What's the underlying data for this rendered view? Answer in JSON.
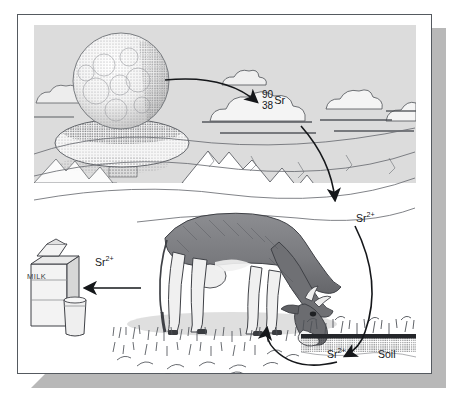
{
  "figure": {
    "type": "scientific-illustration"
  },
  "frame": {
    "border_color": "#555a60",
    "shadow_color": "#b8b8b8",
    "page_background": "#ffffff"
  },
  "sky": {
    "background_color": "#dcdcdc"
  },
  "labels": {
    "isotope": {
      "mass_number": "90",
      "atomic_number": "38",
      "symbol": "Sr"
    },
    "strontium_ion_air": {
      "symbol": "Sr",
      "charge": "2+"
    },
    "strontium_ion_milk": {
      "symbol": "Sr",
      "charge": "2+"
    },
    "strontium_ion_soil": {
      "symbol": "Sr",
      "charge": "2+"
    },
    "soil": "Soil",
    "milk_carton": "MILK"
  },
  "elements": {
    "mushroom_cloud": "mushroom-cloud",
    "clouds": "cumulus-clouds",
    "mountains": "mountain-range",
    "cow": "grazing-cow",
    "grass": "grass-field",
    "soil_layer": "soil-layer",
    "milk_carton": "milk-carton",
    "milk_glass": "milk-glass"
  },
  "arrows": [
    {
      "name": "cloud-to-isotope",
      "from": "mushroom-cloud",
      "to": "isotope-label"
    },
    {
      "name": "isotope-to-air-ion",
      "from": "isotope-label",
      "to": "strontium-ion-air"
    },
    {
      "name": "air-ion-to-soil",
      "from": "strontium-ion-air",
      "to": "soil"
    },
    {
      "name": "soil-to-grass",
      "from": "soil",
      "to": "grass"
    },
    {
      "name": "cow-to-milk",
      "from": "cow",
      "to": "milk-carton"
    }
  ],
  "colors": {
    "ink": "#15171a",
    "cow_body": "#7e7f83",
    "cow_shade": "#5d5e63",
    "line": "#4a4d52",
    "grass": "#4e5157"
  }
}
